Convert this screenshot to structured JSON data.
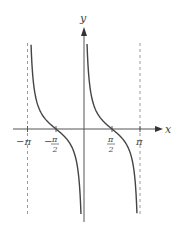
{
  "chart_data": {
    "type": "line",
    "function": "y = cot(x)",
    "title": "",
    "xlabel": "x",
    "ylabel": "y",
    "x_ticks": [
      {
        "value": -3.14159,
        "label": "−π"
      },
      {
        "value": -1.5708,
        "label": "−π/2"
      },
      {
        "value": 1.5708,
        "label": "π/2"
      },
      {
        "value": 3.14159,
        "label": "π"
      }
    ],
    "asymptotes_dashed": [
      -3.14159,
      3.14159
    ],
    "asymptote_solid_at_origin": 0,
    "xlim": [
      -3.14159,
      3.14159
    ],
    "ylim": [
      -5.8,
      5.8
    ],
    "series": [
      {
        "name": "cot(x) branch on (-π, 0)",
        "x_range": [
          -2.97,
          -0.17
        ],
        "zero_crossing": -1.5708
      },
      {
        "name": "cot(x) branch on (0, π)",
        "x_range": [
          0.17,
          2.97
        ],
        "zero_crossing": 1.5708
      }
    ],
    "grid": false,
    "legend": null,
    "colors": {
      "curve": "#444444",
      "axis": "#555555",
      "asymptote": "#999999"
    }
  },
  "labels": {
    "x_axis": "x",
    "y_axis": "y",
    "neg_pi": "−π",
    "neg_half_pi_num": "π",
    "neg_half_pi_sign": "−",
    "half_pi_den": "2",
    "half_pi_num": "π",
    "pi": "π"
  }
}
